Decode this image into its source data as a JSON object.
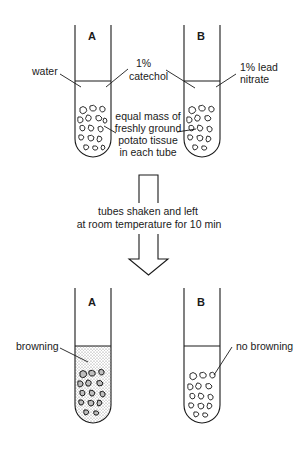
{
  "diagram": {
    "before": {
      "tube_a": {
        "letter": "A",
        "liquid_label": "water"
      },
      "tube_b": {
        "letter": "B",
        "liquid_label_line1": "1% lead",
        "liquid_label_line2": "nitrate"
      },
      "center_label": {
        "line1": "1%",
        "line2": "catechol"
      },
      "tissue_label": {
        "line1": "equal mass of",
        "line2": "freshly ground",
        "line3": "potato tissue",
        "line4": "in each tube"
      }
    },
    "process": {
      "line1": "tubes shaken and left",
      "line2": "at room temperature for 10 min"
    },
    "after": {
      "tube_a": {
        "letter": "A",
        "result_label": "browning"
      },
      "tube_b": {
        "letter": "B",
        "result_label": "no browning"
      }
    },
    "colors": {
      "ink": "#1a1a1a",
      "background": "#ffffff",
      "browning_stipple": "#9a9a9a"
    }
  }
}
